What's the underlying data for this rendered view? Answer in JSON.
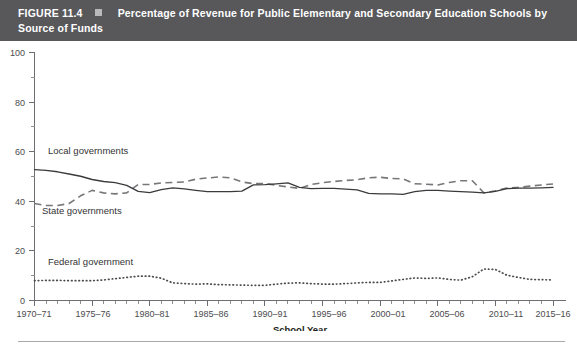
{
  "banner": {
    "figure_label": "FIGURE 11.4",
    "marker": "square-bullet",
    "title": "Percentage of Revenue for Public Elementary and Secondary Education Schools by Source of Funds"
  },
  "colors": {
    "banner_background": "#58585b",
    "banner_text": "#ffffff",
    "banner_square": "#b9b9bc",
    "axis": "#6d6e71",
    "local_line": "#3b3b3d",
    "state_line": "#76777a",
    "federal_line": "#4b4b4d",
    "bottom_rule": "#a7a9ac",
    "page_background": "#ffffff"
  },
  "axes": {
    "y_ticks": [
      "0",
      "20",
      "40",
      "60",
      "80",
      "100"
    ],
    "x_ticks": [
      "1970–71",
      "1975–76",
      "1980–81",
      "1985–86",
      "1990–91",
      "1995–96",
      "2000–01",
      "2005–06",
      "2010–11",
      "2015–16"
    ],
    "x_title": "School Year",
    "y_title": ""
  },
  "series_labels": {
    "local": "Local governments",
    "state": "State governments",
    "federal": "Federal government"
  },
  "chart_data": {
    "type": "line",
    "title": "Percentage of Revenue for Public Elementary and Secondary Education Schools by Source of Funds",
    "subtitle": "",
    "xlabel": "School Year",
    "ylabel": "",
    "ylim": [
      0,
      100
    ],
    "ytick_interval": 20,
    "yminor_interval": 10,
    "grid": false,
    "legend": "inline-labels",
    "x": [
      "1970-71",
      "1971-72",
      "1972-73",
      "1973-74",
      "1974-75",
      "1975-76",
      "1976-77",
      "1977-78",
      "1978-79",
      "1979-80",
      "1980-81",
      "1981-82",
      "1982-83",
      "1983-84",
      "1984-85",
      "1985-86",
      "1986-87",
      "1987-88",
      "1988-89",
      "1989-90",
      "1990-91",
      "1991-92",
      "1992-93",
      "1993-94",
      "1994-95",
      "1995-96",
      "1996-97",
      "1997-98",
      "1998-99",
      "1999-2000",
      "2000-01",
      "2001-02",
      "2002-03",
      "2003-04",
      "2004-05",
      "2005-06",
      "2006-07",
      "2007-08",
      "2008-09",
      "2009-10",
      "2010-11",
      "2011-12",
      "2012-13",
      "2013-14",
      "2014-15",
      "2015-16"
    ],
    "series": [
      {
        "name": "Local governments",
        "style": "solid",
        "values": [
          52.8,
          52.5,
          51.9,
          51.0,
          50.1,
          48.8,
          48.0,
          47.5,
          46.4,
          44.0,
          43.5,
          44.7,
          45.4,
          45.0,
          44.4,
          43.9,
          43.9,
          43.9,
          44.1,
          46.6,
          46.7,
          47.0,
          47.4,
          45.6,
          45.1,
          45.2,
          45.2,
          44.9,
          44.6,
          43.2,
          43.0,
          43.0,
          42.8,
          43.9,
          44.4,
          44.4,
          44.1,
          43.9,
          43.7,
          43.4,
          44.0,
          45.1,
          45.3,
          45.3,
          45.4,
          45.6
        ],
        "color": "#3b3b3d"
      },
      {
        "name": "State governments",
        "style": "dashed",
        "values": [
          39.1,
          38.3,
          38.3,
          39.1,
          42.2,
          44.4,
          43.4,
          43.0,
          43.4,
          46.8,
          46.8,
          47.4,
          47.6,
          47.8,
          48.9,
          49.4,
          49.8,
          49.5,
          47.8,
          47.1,
          47.2,
          46.4,
          45.8,
          45.2,
          46.8,
          47.5,
          48.0,
          48.4,
          48.7,
          49.5,
          49.7,
          49.2,
          49.0,
          47.1,
          46.9,
          46.6,
          47.6,
          48.3,
          48.3,
          43.4,
          44.2,
          45.4,
          45.6,
          46.1,
          46.6,
          47.0
        ],
        "color": "#76777a"
      },
      {
        "name": "Federal government",
        "style": "dotted",
        "values": [
          8.0,
          8.1,
          8.1,
          8.0,
          8.0,
          8.0,
          8.3,
          8.8,
          9.3,
          9.8,
          9.8,
          9.0,
          7.1,
          6.8,
          6.6,
          6.7,
          6.4,
          6.3,
          6.2,
          6.1,
          6.1,
          6.6,
          7.0,
          7.1,
          6.8,
          6.6,
          6.6,
          6.8,
          7.1,
          7.3,
          7.3,
          7.9,
          8.5,
          9.1,
          8.9,
          9.1,
          8.5,
          8.2,
          9.6,
          12.7,
          12.5,
          10.2,
          9.3,
          8.5,
          8.4,
          8.3
        ],
        "color": "#4b4b4d"
      }
    ]
  }
}
